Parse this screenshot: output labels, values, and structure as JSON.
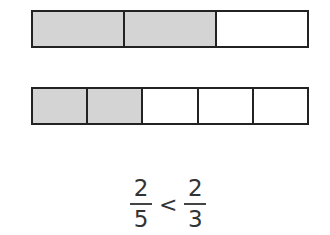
{
  "bars": [
    {
      "name": "thirds-bar",
      "segments": 3,
      "shaded": 2
    },
    {
      "name": "fifths-bar",
      "segments": 5,
      "shaded": 2
    }
  ],
  "colors": {
    "shaded": "#d4d4d4",
    "border": "#222222",
    "empty": "#ffffff"
  },
  "comparison": {
    "left": {
      "numerator": "2",
      "denominator": "5"
    },
    "operator": "<",
    "right": {
      "numerator": "2",
      "denominator": "3"
    }
  }
}
